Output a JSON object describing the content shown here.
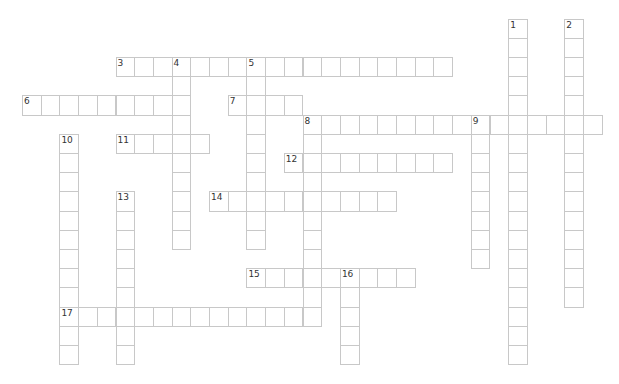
{
  "puzzle": {
    "type": "crossword",
    "grid": {
      "origin_x": 22,
      "origin_y": 18.6,
      "cell_w": 18.7,
      "cell_h": 19.2
    },
    "colors": {
      "border": "#c8c8c8",
      "number": "#333333",
      "background": "#ffffff"
    },
    "words": [
      {
        "number": "1",
        "direction": "down",
        "row": 0,
        "col": 26,
        "length": 18
      },
      {
        "number": "2",
        "direction": "down",
        "row": 0,
        "col": 29,
        "length": 15
      },
      {
        "number": "3",
        "direction": "across",
        "row": 2,
        "col": 5,
        "length": 18
      },
      {
        "number": "4",
        "direction": "down",
        "row": 2,
        "col": 8,
        "length": 10
      },
      {
        "number": "5",
        "direction": "down",
        "row": 2,
        "col": 12,
        "length": 10
      },
      {
        "number": "6",
        "direction": "across",
        "row": 4,
        "col": 0,
        "length": 9
      },
      {
        "number": "7",
        "direction": "across",
        "row": 4,
        "col": 11,
        "length": 4
      },
      {
        "number": "8",
        "direction": "across",
        "row": 5,
        "col": 15,
        "length": 16
      },
      {
        "number": "8",
        "direction": "down",
        "row": 5,
        "col": 15,
        "length": 11
      },
      {
        "number": "9",
        "direction": "down",
        "row": 5,
        "col": 24,
        "length": 8
      },
      {
        "number": "10",
        "direction": "down",
        "row": 6,
        "col": 2,
        "length": 12
      },
      {
        "number": "11",
        "direction": "across",
        "row": 6,
        "col": 5,
        "length": 5
      },
      {
        "number": "12",
        "direction": "across",
        "row": 7,
        "col": 14,
        "length": 9
      },
      {
        "number": "13",
        "direction": "down",
        "row": 9,
        "col": 5,
        "length": 9
      },
      {
        "number": "14",
        "direction": "across",
        "row": 9,
        "col": 10,
        "length": 10
      },
      {
        "number": "15",
        "direction": "across",
        "row": 13,
        "col": 12,
        "length": 9
      },
      {
        "number": "16",
        "direction": "down",
        "row": 13,
        "col": 17,
        "length": 5
      },
      {
        "number": "17",
        "direction": "across",
        "row": 15,
        "col": 2,
        "length": 14
      }
    ]
  }
}
